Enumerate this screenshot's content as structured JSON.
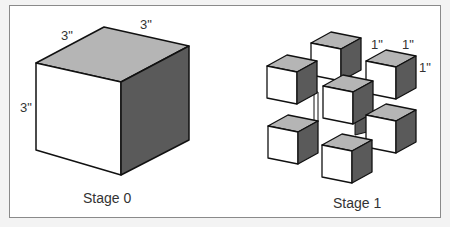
{
  "figure": {
    "panels": [
      {
        "caption": "Stage 0",
        "dimension_labels": [
          "3\"",
          "3\"",
          "3\""
        ],
        "cube_count": 1
      },
      {
        "caption": "Stage 1",
        "dimension_labels": [
          "1\"",
          "1\"",
          "1\""
        ],
        "cube_count": 8
      }
    ],
    "colors": {
      "top_face": "#b5b5b5",
      "front_face": "#ffffff",
      "side_face": "#5a5a5a",
      "edge": "#111111",
      "frame_border": "#8a8a8a"
    }
  }
}
